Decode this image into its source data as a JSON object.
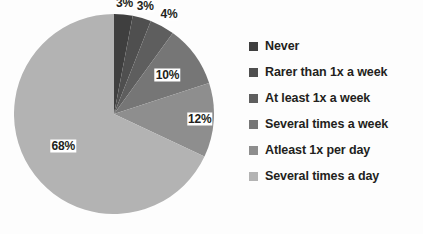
{
  "chart_data": {
    "type": "pie",
    "title": "",
    "subtitle": "",
    "xlabel": "",
    "ylabel": "",
    "legend_position": "right",
    "grid": false,
    "start_angle_deg": 0,
    "direction": "clockwise",
    "categories": [
      "Never",
      "Rarer than 1x a week",
      "At least 1x a week",
      "Several times a week",
      "Atleast 1x per day",
      "Several times a day"
    ],
    "values": [
      3,
      3,
      4,
      10,
      12,
      68
    ],
    "value_labels": [
      "3%",
      "3%",
      "4%",
      "10%",
      "12%",
      "68%"
    ],
    "colors": [
      "#3f3f3f",
      "#4f4f4f",
      "#5e5e5e",
      "#767676",
      "#8e8e8e",
      "#b3b3b3"
    ]
  },
  "legend": {
    "items": [
      {
        "label": "Never",
        "color": "#3f3f3f"
      },
      {
        "label": "Rarer than 1x a week",
        "color": "#4f4f4f"
      },
      {
        "label": "At least 1x a week",
        "color": "#5e5e5e"
      },
      {
        "label": "Several times a week",
        "color": "#767676"
      },
      {
        "label": "Atleast 1x per day",
        "color": "#8e8e8e"
      },
      {
        "label": "Several times a day",
        "color": "#b3b3b3"
      }
    ]
  },
  "canvas": {
    "background": "#fdfdfd",
    "label_text_color": "#231f20",
    "label_background": "#ffffff"
  }
}
